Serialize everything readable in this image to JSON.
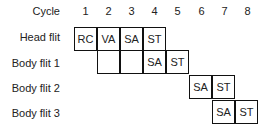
{
  "diagram": {
    "column_header_label": "Cycle",
    "cycles": [
      "1",
      "2",
      "3",
      "4",
      "5",
      "6",
      "7",
      "8"
    ],
    "rows": [
      {
        "label": "Head flit",
        "cells": [
          {
            "cycle": 1,
            "stage": "RC"
          },
          {
            "cycle": 2,
            "stage": "VA"
          },
          {
            "cycle": 3,
            "stage": "SA"
          },
          {
            "cycle": 4,
            "stage": "ST"
          }
        ]
      },
      {
        "label": "Body flit 1",
        "cells": [
          {
            "cycle": 2,
            "stage": ""
          },
          {
            "cycle": 3,
            "stage": ""
          },
          {
            "cycle": 4,
            "stage": "SA"
          },
          {
            "cycle": 5,
            "stage": "ST"
          }
        ]
      },
      {
        "label": "Body flit 2",
        "cells": [
          {
            "cycle": 6,
            "stage": "SA"
          },
          {
            "cycle": 7,
            "stage": "ST"
          }
        ]
      },
      {
        "label": "Body flit 3",
        "cells": [
          {
            "cycle": 7,
            "stage": "SA"
          },
          {
            "cycle": 8,
            "stage": "ST"
          }
        ]
      }
    ]
  }
}
